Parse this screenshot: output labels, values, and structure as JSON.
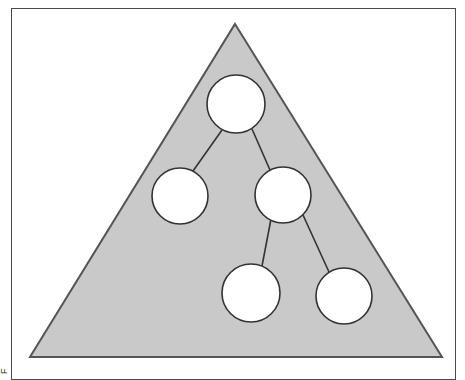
{
  "figure": {
    "type": "diagram",
    "margin_caption_text": "Figure",
    "colors": {
      "triangle_fill": "#c9c9c9",
      "triangle_stroke": "#555555",
      "circle_fill": "#ffffff",
      "circle_stroke": "#333333",
      "edge_stroke": "#333333",
      "frame_stroke": "#4a4a4a",
      "page_background": "#ffffff"
    },
    "canvas": {
      "width": 443,
      "height": 365
    },
    "triangle": {
      "name": "shaded-triangle",
      "points": "223,15 430,348 18,348",
      "stroke_width": 2
    },
    "nodes": [
      {
        "id": "n1",
        "label": "",
        "cx": 224,
        "cy": 95,
        "r": 29
      },
      {
        "id": "n2",
        "label": "",
        "cx": 168,
        "cy": 187,
        "r": 28
      },
      {
        "id": "n3",
        "label": "",
        "cx": 271,
        "cy": 186,
        "r": 28
      },
      {
        "id": "n4",
        "label": "",
        "cx": 239,
        "cy": 284,
        "r": 29
      },
      {
        "id": "n5",
        "label": "",
        "cx": 332,
        "cy": 287,
        "r": 28
      }
    ],
    "edges": [
      {
        "id": "e1",
        "from": "n1",
        "to": "n2",
        "x1": 210,
        "y1": 121,
        "x2": 181,
        "y2": 162
      },
      {
        "id": "e2",
        "from": "n1",
        "to": "n3",
        "x1": 240,
        "y1": 120,
        "x2": 258,
        "y2": 161
      },
      {
        "id": "e3",
        "from": "n3",
        "to": "n4",
        "x1": 259,
        "y1": 210,
        "x2": 250,
        "y2": 257
      },
      {
        "id": "e4",
        "from": "n3",
        "to": "n5",
        "x1": 291,
        "y1": 206,
        "x2": 317,
        "y2": 263
      }
    ],
    "edge_stroke_width": 1.6,
    "node_stroke_width": 1.6
  }
}
